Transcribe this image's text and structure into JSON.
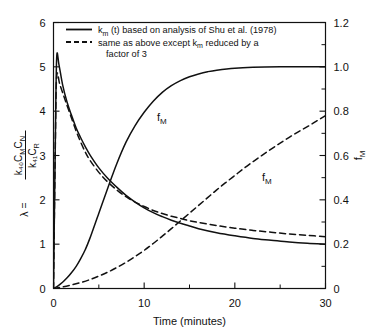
{
  "chart_data": {
    "type": "line",
    "title": "",
    "xlabel": "Time (minutes)",
    "ylabel_left": "λ = k₄₀CₘCₙ / k₄₁Cᵣ",
    "ylabel_right": "fₘ",
    "xlim": [
      0,
      30
    ],
    "ylim_left": [
      0,
      6
    ],
    "ylim_right": [
      0,
      1.2
    ],
    "xticks": [
      0,
      10,
      20,
      30
    ],
    "xticklabels": [
      "0",
      "10",
      "20",
      "30"
    ],
    "xminor": [
      5,
      15,
      25
    ],
    "yticks_left": [
      0,
      1,
      2,
      3,
      4,
      5,
      6
    ],
    "yticklabels_left": [
      "0",
      "1",
      "2",
      "3",
      "4",
      "5",
      "6"
    ],
    "yticks_right": [
      0,
      0.2,
      0.4,
      0.6,
      0.8,
      1.0,
      1.2
    ],
    "yticklabels_right": [
      "0",
      "0.2",
      "0.4",
      "0.6",
      "0.8",
      "1.0",
      "1.2"
    ],
    "yminor_right": [
      0.1,
      0.3,
      0.5,
      0.7,
      0.9,
      1.1
    ],
    "grid": false,
    "legend_position": "upper-center",
    "series": [
      {
        "name": "lambda-solid",
        "label": "λ, kₘ(t) based on analysis of Shu et al. (1978)",
        "style": "solid",
        "axis": "left",
        "x": [
          0.0,
          0.2,
          0.35,
          0.6,
          1.0,
          1.5,
          2.0,
          2.5,
          3.0,
          3.5,
          4.0,
          5.0,
          6.0,
          7.0,
          8.0,
          9.0,
          10.0,
          11.0,
          12.0,
          13.0,
          14.0,
          15.0,
          16.0,
          18.0,
          20.0,
          22.0,
          24.0,
          26.0,
          28.0,
          30.0
        ],
        "y": [
          0.0,
          3.3,
          5.2,
          5.05,
          4.6,
          4.2,
          3.9,
          3.62,
          3.4,
          3.2,
          3.02,
          2.72,
          2.48,
          2.28,
          2.1,
          1.95,
          1.82,
          1.71,
          1.62,
          1.54,
          1.47,
          1.41,
          1.35,
          1.26,
          1.19,
          1.13,
          1.09,
          1.05,
          1.02,
          1.0
        ]
      },
      {
        "name": "lambda-dashed",
        "label": "λ, same as above except kₘ reduced by a factor of 3",
        "style": "dashed",
        "axis": "left",
        "x": [
          0.0,
          0.2,
          0.35,
          0.7,
          1.2,
          1.8,
          2.5,
          3.0,
          3.5,
          4.0,
          5.0,
          6.0,
          7.0,
          8.0,
          9.0,
          10.0,
          11.0,
          12.0,
          13.0,
          14.0,
          15.0,
          16.0,
          18.0,
          20.0,
          22.0,
          24.0,
          26.0,
          28.0,
          30.0
        ],
        "y": [
          0.0,
          3.2,
          4.78,
          4.6,
          4.3,
          3.95,
          3.55,
          3.3,
          3.08,
          2.9,
          2.62,
          2.4,
          2.22,
          2.07,
          1.95,
          1.85,
          1.76,
          1.69,
          1.63,
          1.58,
          1.53,
          1.49,
          1.42,
          1.36,
          1.31,
          1.27,
          1.23,
          1.2,
          1.17
        ]
      },
      {
        "name": "fm-solid",
        "label": "fₘ, kₘ(t) based on analysis of Shu et al. (1978)",
        "style": "solid",
        "axis": "right",
        "x": [
          0.0,
          0.5,
          1.0,
          1.5,
          2.0,
          2.5,
          3.0,
          3.5,
          4.0,
          5.0,
          6.0,
          7.0,
          8.0,
          9.0,
          10.0,
          11.0,
          12.0,
          13.0,
          14.0,
          15.0,
          16.0,
          17.0,
          18.0,
          20.0,
          22.0,
          25.0,
          28.0,
          30.0
        ],
        "y": [
          0.0,
          0.012,
          0.028,
          0.048,
          0.072,
          0.1,
          0.135,
          0.175,
          0.225,
          0.34,
          0.455,
          0.565,
          0.66,
          0.735,
          0.795,
          0.845,
          0.885,
          0.915,
          0.938,
          0.955,
          0.968,
          0.978,
          0.985,
          0.994,
          0.998,
          1.0,
          1.0,
          1.0
        ]
      },
      {
        "name": "fm-dashed",
        "label": "fₘ, same as above except kₘ reduced by a factor of 3",
        "style": "dashed",
        "axis": "right",
        "x": [
          0.0,
          1.0,
          2.0,
          3.0,
          4.0,
          5.0,
          6.0,
          7.0,
          8.0,
          9.0,
          10.0,
          11.0,
          12.0,
          13.0,
          14.0,
          15.0,
          16.0,
          17.0,
          18.0,
          19.0,
          20.0,
          21.0,
          22.0,
          23.0,
          24.0,
          25.0,
          26.0,
          27.0,
          28.0,
          29.0,
          30.0
        ],
        "y": [
          0.0,
          0.007,
          0.016,
          0.027,
          0.04,
          0.056,
          0.074,
          0.095,
          0.118,
          0.144,
          0.172,
          0.203,
          0.236,
          0.27,
          0.305,
          0.34,
          0.375,
          0.41,
          0.445,
          0.478,
          0.51,
          0.542,
          0.572,
          0.601,
          0.629,
          0.656,
          0.682,
          0.707,
          0.73,
          0.755,
          0.78
        ]
      }
    ],
    "annotations": [
      {
        "name": "fm-solid-label",
        "text": "f",
        "sub": "M",
        "x_px": 157,
        "y_px": 121
      },
      {
        "name": "fm-dashed-label",
        "text": "f",
        "sub": "M",
        "x_px": 262,
        "y_px": 181
      }
    ],
    "legend": {
      "entries": [
        {
          "style": "solid",
          "text_parts": [
            "k",
            "m",
            " (t) based on  analysis of  Shu et al. (1978)"
          ]
        },
        {
          "style": "dashed",
          "text_parts": [
            "same as  above except k",
            "m",
            "  reduced by a"
          ]
        },
        {
          "style": "none",
          "text_parts": [
            "factor of  3"
          ]
        }
      ]
    },
    "ylabel_left_parts": {
      "lead": "λ =",
      "numerator": "k₄₀C",
      "num_sub1": "M",
      "num_mid": "C",
      "num_sub2": "N",
      "denominator": "k₄₁C",
      "den_sub": "R"
    },
    "ylabel_right_parts": {
      "main": "f",
      "sub": "M"
    }
  }
}
